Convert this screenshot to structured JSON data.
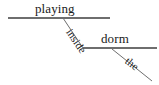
{
  "diagram": {
    "type": "reed-kellogg-sentence-diagram",
    "background_color": "#ffffff",
    "line_color": "#6e6e6e",
    "text_color": "#1a1a1a",
    "canvas": {
      "width": 159,
      "height": 85
    },
    "labels": {
      "predicate": "playing",
      "preposition": "inside",
      "object_of_preposition": "dorm",
      "article": "the"
    },
    "lines": [
      {
        "name": "main-baseline",
        "orientation": "horizontal",
        "x1": 8,
        "y1": 18,
        "x2": 110,
        "y2": 18
      },
      {
        "name": "preposition-slant",
        "orientation": "diagonal",
        "x1": 63,
        "y1": 18,
        "x2": 83,
        "y2": 48
      },
      {
        "name": "object-baseline",
        "orientation": "horizontal",
        "x1": 83,
        "y1": 48,
        "x2": 157,
        "y2": 48
      },
      {
        "name": "article-slant",
        "orientation": "diagonal",
        "x1": 112,
        "y1": 49,
        "x2": 152,
        "y2": 81
      }
    ]
  }
}
